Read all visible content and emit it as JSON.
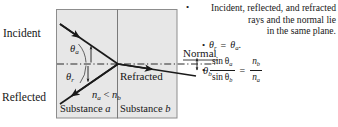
{
  "figure": {
    "kind": "optics-refraction-reflection-diagram",
    "colors": {
      "substance_fill": "#e7e7e7",
      "box_border": "#8d8d8d",
      "ray": "#1a1a1a",
      "normal_line": "#2a2a2a",
      "text": "#181818",
      "page_background": "#ffffff"
    },
    "diagram": {
      "labels": {
        "incident": "Incident",
        "reflected": "Reflected",
        "refracted": "Refracted",
        "normal": "Normal",
        "theta_a": "θ",
        "theta_a_sub": "a",
        "theta_r": "θ",
        "theta_r_sub": "r",
        "theta_b": "θ",
        "theta_b_sub": "b",
        "index_n": "n",
        "index_a_sub": "a",
        "index_b_sub": "b",
        "less_than": "<",
        "substance_a": "Substance",
        "substance_a_sub": "a",
        "substance_b": "Substance",
        "substance_b_sub": "b"
      }
    },
    "notes": {
      "plane_bullet": "•",
      "plane_line1": "Incident, reflected, and refracted",
      "plane_line2": "rays and the normal lie",
      "plane_line3": "in the same plane.",
      "eq1_bullet": "•",
      "eq1_theta_r": "θ",
      "eq1_theta_r_sub": "r",
      "eq1_equals": "=",
      "eq1_theta_a": "θ",
      "eq1_theta_a_sub": "a",
      "eq1_period": ".",
      "eq2_bullet": "•",
      "eq2_num": "sin θ",
      "eq2_num_sub": "a",
      "eq2_den": "sin θ",
      "eq2_den_sub": "b",
      "eq2_equals": "=",
      "eq2_rhs_num": "n",
      "eq2_rhs_num_sub": "b",
      "eq2_rhs_den": "n",
      "eq2_rhs_den_sub": "a"
    }
  }
}
